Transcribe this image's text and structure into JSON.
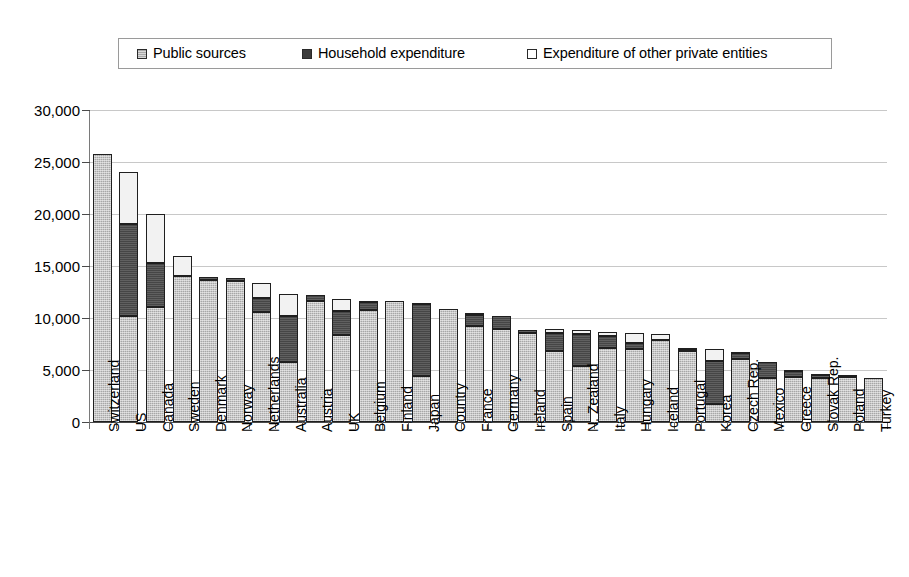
{
  "legend": {
    "items": [
      {
        "label": "Public sources",
        "key": "public",
        "color": "#a7a7a7"
      },
      {
        "label": "Household expenditure",
        "key": "household",
        "color": "#464646"
      },
      {
        "label": "Expenditure of other private entities",
        "key": "private",
        "color": "#ffffff"
      }
    ]
  },
  "chart_data": {
    "type": "bar",
    "stacked": true,
    "title": "",
    "subtitle": "",
    "xlabel": "",
    "ylabel": "",
    "ylim": [
      0,
      30000
    ],
    "ytick_labels": [
      "0",
      "5,000",
      "10,000",
      "15,000",
      "20,000",
      "25,000",
      "30,000"
    ],
    "ytick_values": [
      0,
      5000,
      10000,
      15000,
      20000,
      25000,
      30000
    ],
    "grid": true,
    "legend_position": "top",
    "categories": [
      "Switzerland",
      "US",
      "Canada",
      "Sweden",
      "Denmark",
      "Norway",
      "Netherlands",
      "Australia",
      "Austria",
      "UK",
      "Belgium",
      "Finland",
      "Japan",
      "Country",
      "France",
      "Germany",
      "Ireland",
      "Spain",
      "N. Zealand",
      "Italy",
      "Hungary",
      "Iceland",
      "Portugal",
      "Korea",
      "Czech Rep.",
      "Mexico",
      "Greece",
      "Slovak Rep.",
      "Poland",
      "Turkey"
    ],
    "series": [
      {
        "name": "Public sources",
        "values": [
          25800,
          10200,
          11100,
          14000,
          13700,
          13600,
          10600,
          5800,
          11600,
          8400,
          10800,
          11600,
          4400,
          10900,
          9200,
          8900,
          8600,
          6800,
          5400,
          7100,
          7000,
          7900,
          6800,
          1700,
          6100,
          4200,
          4300,
          4200,
          4300,
          4200
        ]
      },
      {
        "name": "Household expenditure",
        "values": [
          0,
          8800,
          4200,
          0,
          200,
          200,
          1300,
          4400,
          600,
          2300,
          700,
          0,
          6900,
          0,
          1100,
          1300,
          200,
          1800,
          3100,
          1200,
          600,
          0,
          200,
          4200,
          500,
          1600,
          600,
          300,
          200,
          0
        ]
      },
      {
        "name": "Expenditure of other private entities",
        "values": [
          0,
          5000,
          4700,
          2000,
          0,
          0,
          1500,
          2100,
          0,
          1100,
          100,
          0,
          100,
          0,
          200,
          0,
          0,
          300,
          300,
          400,
          1000,
          600,
          100,
          1100,
          100,
          0,
          100,
          100,
          0,
          0
        ]
      }
    ],
    "totals": [
      25800,
      24000,
      20000,
      16000,
      13900,
      13800,
      13400,
      12300,
      12200,
      11800,
      11600,
      11600,
      11400,
      10900,
      10500,
      10200,
      8800,
      8900,
      8800,
      8700,
      8600,
      8500,
      7100,
      7000,
      6700,
      5800,
      5000,
      4600,
      4500,
      4200
    ]
  }
}
